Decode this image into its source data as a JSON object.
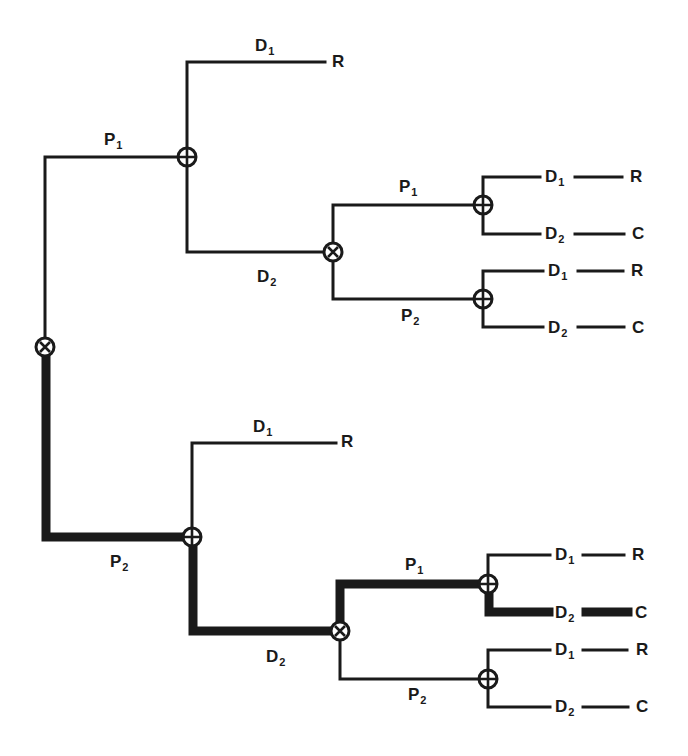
{
  "diagram": {
    "type": "decision-tree",
    "colors": {
      "line": "#1a1a1a",
      "background": "#ffffff"
    },
    "node_symbols": {
      "decision": "circle-x",
      "chance": "circle-plus"
    },
    "nodes": [
      {
        "id": "root",
        "symbol": "circle-x",
        "x": 45,
        "y": 347
      },
      {
        "id": "n_p1",
        "symbol": "circle-plus",
        "x": 187,
        "y": 157
      },
      {
        "id": "n_p1_d2",
        "symbol": "circle-x",
        "x": 333,
        "y": 252
      },
      {
        "id": "n_p1_d2_p1",
        "symbol": "circle-plus",
        "x": 483,
        "y": 205
      },
      {
        "id": "n_p1_d2_p2",
        "symbol": "circle-plus",
        "x": 483,
        "y": 299
      },
      {
        "id": "n_p2",
        "symbol": "circle-plus",
        "x": 192,
        "y": 537
      },
      {
        "id": "n_p2_d2",
        "symbol": "circle-x",
        "x": 340,
        "y": 631
      },
      {
        "id": "n_p2_d2_p1",
        "symbol": "circle-plus",
        "x": 488,
        "y": 584
      },
      {
        "id": "n_p2_d2_p2",
        "symbol": "circle-plus",
        "x": 488,
        "y": 679
      }
    ],
    "labels": [
      {
        "id": "l_top_p1",
        "base": "P",
        "sub": "1",
        "x": 104,
        "y": 131
      },
      {
        "id": "l_top_d1",
        "base": "D",
        "sub": "1",
        "x": 255,
        "y": 37
      },
      {
        "id": "l_top_r",
        "base": "R",
        "sub": "",
        "x": 332,
        "y": 53
      },
      {
        "id": "l_top_d2",
        "base": "D",
        "sub": "2",
        "x": 257,
        "y": 268
      },
      {
        "id": "l_top_d2_p1",
        "base": "P",
        "sub": "1",
        "x": 399,
        "y": 178
      },
      {
        "id": "l_top_d2_p2",
        "base": "P",
        "sub": "2",
        "x": 401,
        "y": 307
      },
      {
        "id": "l_a_d1",
        "base": "D",
        "sub": "1",
        "x": 545,
        "y": 168
      },
      {
        "id": "l_a_r",
        "base": "R",
        "sub": "",
        "x": 630,
        "y": 168
      },
      {
        "id": "l_a_d2",
        "base": "D",
        "sub": "2",
        "x": 545,
        "y": 225
      },
      {
        "id": "l_a_c",
        "base": "C",
        "sub": "",
        "x": 632,
        "y": 225
      },
      {
        "id": "l_b_d1",
        "base": "D",
        "sub": "1",
        "x": 548,
        "y": 262
      },
      {
        "id": "l_b_r",
        "base": "R",
        "sub": "",
        "x": 631,
        "y": 262
      },
      {
        "id": "l_b_d2",
        "base": "D",
        "sub": "2",
        "x": 548,
        "y": 319
      },
      {
        "id": "l_b_c",
        "base": "C",
        "sub": "",
        "x": 632,
        "y": 319
      },
      {
        "id": "l_bot_p2",
        "base": "P",
        "sub": "2",
        "x": 110,
        "y": 553
      },
      {
        "id": "l_bot_d1",
        "base": "D",
        "sub": "1",
        "x": 253,
        "y": 418
      },
      {
        "id": "l_bot_r",
        "base": "R",
        "sub": "",
        "x": 341,
        "y": 433
      },
      {
        "id": "l_bot_d2",
        "base": "D",
        "sub": "2",
        "x": 266,
        "y": 648
      },
      {
        "id": "l_bot_d2_p1",
        "base": "P",
        "sub": "1",
        "x": 405,
        "y": 556
      },
      {
        "id": "l_bot_d2_p2",
        "base": "P",
        "sub": "2",
        "x": 408,
        "y": 686
      },
      {
        "id": "l_c_d1",
        "base": "D",
        "sub": "1",
        "x": 555,
        "y": 546
      },
      {
        "id": "l_c_r",
        "base": "R",
        "sub": "",
        "x": 632,
        "y": 546
      },
      {
        "id": "l_c_d2",
        "base": "D",
        "sub": "2",
        "x": 555,
        "y": 604
      },
      {
        "id": "l_c_c",
        "base": "C",
        "sub": "",
        "x": 635,
        "y": 604
      },
      {
        "id": "l_d_d1",
        "base": "D",
        "sub": "1",
        "x": 555,
        "y": 641
      },
      {
        "id": "l_d_r",
        "base": "R",
        "sub": "",
        "x": 636,
        "y": 641
      },
      {
        "id": "l_d_d2",
        "base": "D",
        "sub": "2",
        "x": 555,
        "y": 698
      },
      {
        "id": "l_d_c",
        "base": "C",
        "sub": "",
        "x": 636,
        "y": 698
      }
    ],
    "highlighted_path": [
      "P2",
      "D2",
      "P1",
      "D2",
      "C"
    ]
  }
}
